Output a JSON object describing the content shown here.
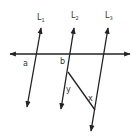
{
  "diagram": {
    "lines": {
      "L1": {
        "label": "L",
        "sub": "1"
      },
      "L2": {
        "label": "L",
        "sub": "2"
      },
      "L3": {
        "label": "L",
        "sub": "3"
      }
    },
    "angles": {
      "a": "a",
      "b": "b",
      "y": "y",
      "x": "x"
    },
    "colors": {
      "stroke": "#222222",
      "text": "#333333"
    }
  }
}
